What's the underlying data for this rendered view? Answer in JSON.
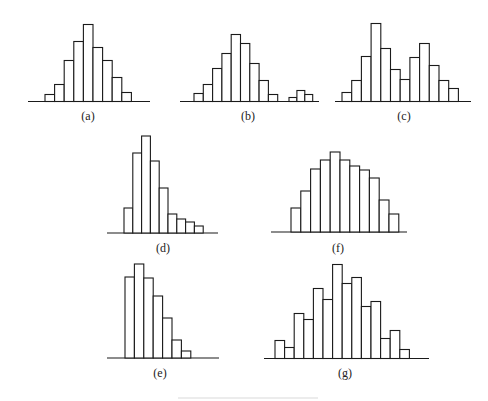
{
  "chart_data": [
    {
      "type": "bar",
      "id": "a",
      "label": "(a)",
      "description": "unimodal symmetric",
      "values": [
        7,
        17,
        41,
        60,
        77,
        54,
        41,
        24,
        9
      ],
      "gaps_after": []
    },
    {
      "type": "bar",
      "id": "b",
      "label": "(b)",
      "description": "unimodal with isolated island",
      "values": [
        8,
        17,
        33,
        48,
        67,
        58,
        38,
        21,
        7
      ],
      "island_values": [
        4,
        11,
        7
      ]
    },
    {
      "type": "bar",
      "id": "c",
      "label": "(c)",
      "description": "bimodal",
      "values": [
        9,
        21,
        45,
        78,
        53,
        32,
        22,
        44,
        58,
        36,
        21,
        13
      ]
    },
    {
      "type": "bar",
      "id": "d",
      "label": "(d)",
      "description": "right-skewed",
      "values": [
        25,
        80,
        97,
        72,
        45,
        19,
        14,
        11,
        7
      ]
    },
    {
      "type": "bar",
      "id": "e",
      "label": "(e)",
      "description": "cliff-like (truncated left)",
      "values": [
        81,
        94,
        80,
        62,
        40,
        18,
        7
      ]
    },
    {
      "type": "bar",
      "id": "f",
      "label": "(f)",
      "description": "flat-topped / plateau",
      "values": [
        24,
        41,
        63,
        72,
        80,
        72,
        66,
        62,
        54,
        32,
        18
      ]
    },
    {
      "type": "bar",
      "id": "g",
      "label": "(g)",
      "description": "comb-toothed",
      "values": [
        18,
        11,
        45,
        39,
        70,
        59,
        94,
        75,
        81,
        52,
        57,
        20,
        28,
        9
      ]
    }
  ],
  "caption": ""
}
